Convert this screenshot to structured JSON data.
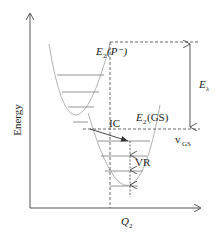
{
  "diagram": {
    "axes": {
      "y_label": "Energy",
      "x_label_main": "Q",
      "x_label_sub": "2"
    },
    "curves": [
      {
        "id": "upper",
        "label_main": "E",
        "label_sub": "2",
        "label_paren": "(P⁻)",
        "vibrational_levels": 4
      },
      {
        "id": "lower",
        "label_main": "E",
        "label_sub": "2",
        "label_paren": "(GS)",
        "vibrational_levels": 5
      }
    ],
    "annotations": {
      "ic": "IC",
      "vr": "VR",
      "lambda_main": "E",
      "lambda_sub": "λ",
      "vgs_main": "v",
      "vgs_sub": "GS"
    },
    "colors": {
      "axis": "#555555",
      "curve": "#aaaaaa",
      "level": "#888888",
      "dash": "#444444",
      "arrow": "#333333"
    }
  }
}
